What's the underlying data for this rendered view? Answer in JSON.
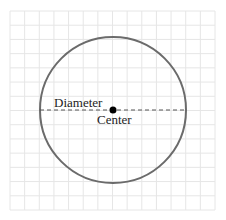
{
  "diagram": {
    "type": "circle-on-grid",
    "grid": {
      "x0": 10,
      "y0": 11,
      "x1": 215,
      "y1": 210,
      "cols": 14,
      "rows": 14,
      "color": "#e6e6e6"
    },
    "circle": {
      "cx": 113,
      "cy": 110,
      "r": 73,
      "stroke": "#6b6b6b",
      "stroke_width": 2
    },
    "diameter": {
      "x1": 40,
      "x2": 186,
      "y": 110,
      "stroke": "#555555",
      "dash": "4,3"
    },
    "center_point": {
      "x": 113,
      "y": 110,
      "r": 3.5,
      "fill": "#000000"
    },
    "labels": {
      "diameter": "Diameter",
      "center": "Center"
    }
  }
}
